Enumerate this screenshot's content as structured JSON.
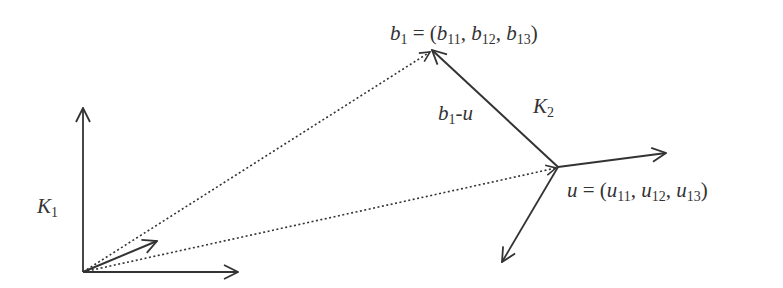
{
  "diagram": {
    "colors": {
      "stroke": "#333333",
      "background": "#ffffff"
    },
    "frame_k1": {
      "label": "K",
      "subscript": "1",
      "origin": [
        83,
        272
      ],
      "axis_up_tip": [
        83,
        108
      ],
      "axis_right_tip": [
        238,
        272
      ],
      "axis_diag_tip": [
        157,
        241
      ]
    },
    "point_b1": {
      "position": [
        432,
        50
      ],
      "label_main": "b",
      "label_sub": "1",
      "eq": " = (",
      "comp1": "b",
      "comp1_sub": "11",
      "comp2": "b",
      "comp2_sub": "12",
      "comp3": "b",
      "comp3_sub": "13",
      "close": ")",
      "sep": ", "
    },
    "point_u": {
      "position": [
        558,
        167
      ],
      "label_main": "u",
      "eq": " = (",
      "comp1": "u",
      "comp1_sub": "11",
      "comp2": "u",
      "comp2_sub": "12",
      "comp3": "u",
      "comp3_sub": "13",
      "close": ")",
      "sep": ", "
    },
    "frame_k2": {
      "label": "K",
      "subscript": "2",
      "axis_right_tip": [
        666,
        153
      ],
      "axis_downleft_tip": [
        502,
        262
      ]
    },
    "vector_b1_minus_u": {
      "label_main": "b",
      "label_sub": "1",
      "label_rest": "-u"
    },
    "dotted_lines": [
      {
        "from": "origin",
        "to": "b1"
      },
      {
        "from": "origin",
        "to": "u"
      }
    ]
  }
}
